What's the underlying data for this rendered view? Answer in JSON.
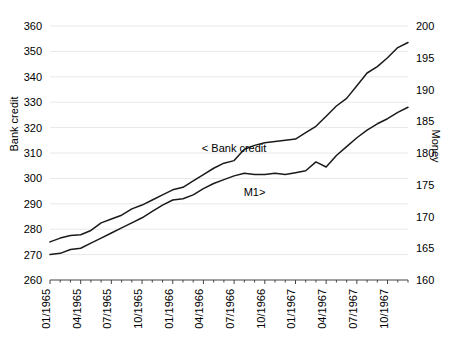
{
  "chart_data": {
    "type": "line",
    "title": "",
    "xlabel": "",
    "ylabel": "Bank credit",
    "ylabel_right": "Money",
    "grid": true,
    "legend_position": "inline-annotation",
    "x": [
      "01/1965",
      "02/1965",
      "03/1965",
      "04/1965",
      "05/1965",
      "06/1965",
      "07/1965",
      "08/1965",
      "09/1965",
      "10/1965",
      "11/1965",
      "12/1965",
      "01/1966",
      "02/1966",
      "03/1966",
      "04/1966",
      "05/1966",
      "06/1966",
      "07/1966",
      "08/1966",
      "09/1966",
      "10/1966",
      "11/1966",
      "12/1966",
      "01/1967",
      "02/1967",
      "03/1967",
      "04/1967",
      "05/1967",
      "06/1967",
      "07/1967",
      "08/1967",
      "09/1967",
      "10/1967",
      "11/1967",
      "12/1967"
    ],
    "xtick_labels": [
      "01/1965",
      "04/1965",
      "07/1965",
      "10/1965",
      "01/1966",
      "04/1966",
      "07/1966",
      "10/1966",
      "01/1967",
      "04/1967",
      "07/1967",
      "10/1967"
    ],
    "xtick_indices": [
      0,
      3,
      6,
      9,
      12,
      15,
      18,
      21,
      24,
      27,
      30,
      33
    ],
    "ytick_labels_left": [
      "260",
      "270",
      "280",
      "290",
      "300",
      "310",
      "320",
      "330",
      "340",
      "350",
      "360"
    ],
    "ytick_values_left": [
      260,
      270,
      280,
      290,
      300,
      310,
      320,
      330,
      340,
      350,
      360
    ],
    "ylim_left": [
      260,
      360
    ],
    "ytick_labels_right": [
      "160",
      "165",
      "170",
      "175",
      "180",
      "185",
      "190",
      "195",
      "200"
    ],
    "ytick_values_right": [
      160,
      165,
      170,
      175,
      180,
      185,
      190,
      195,
      200
    ],
    "ylim_right": [
      160,
      200
    ],
    "series": [
      {
        "name": "Bank credit",
        "annotation": "< Bank credit",
        "axis": "left",
        "color": "#1a1a1a",
        "values": [
          275.0,
          276.5,
          277.5,
          277.8,
          279.5,
          282.5,
          284.0,
          285.5,
          288.0,
          289.5,
          291.5,
          293.5,
          295.5,
          296.5,
          299.0,
          301.5,
          304.0,
          306.0,
          307.0,
          311.5,
          313.0,
          314.0,
          314.5,
          315.0,
          315.5,
          318.0,
          320.5,
          324.5,
          328.5,
          331.5,
          336.5,
          341.5,
          344.0,
          347.5,
          351.5,
          353.5
        ]
      },
      {
        "name": "M1",
        "annotation": "M1>",
        "axis": "right",
        "color": "#1a1a1a",
        "values": [
          164.0,
          164.2,
          164.8,
          165.0,
          165.8,
          166.6,
          167.4,
          168.2,
          169.0,
          169.8,
          170.8,
          171.8,
          172.6,
          172.8,
          173.4,
          174.4,
          175.2,
          175.8,
          176.4,
          176.8,
          176.6,
          176.6,
          176.8,
          176.6,
          176.9,
          177.2,
          178.6,
          177.8,
          179.6,
          181.0,
          182.4,
          183.6,
          184.6,
          185.4,
          186.4,
          187.2
        ]
      }
    ],
    "annotations": [
      {
        "text": "< Bank credit",
        "x_index": 18,
        "y_value": 310.5,
        "axis": "left"
      },
      {
        "text": "M1>",
        "x_index": 20,
        "y_value": 173.3,
        "axis": "right"
      }
    ]
  }
}
